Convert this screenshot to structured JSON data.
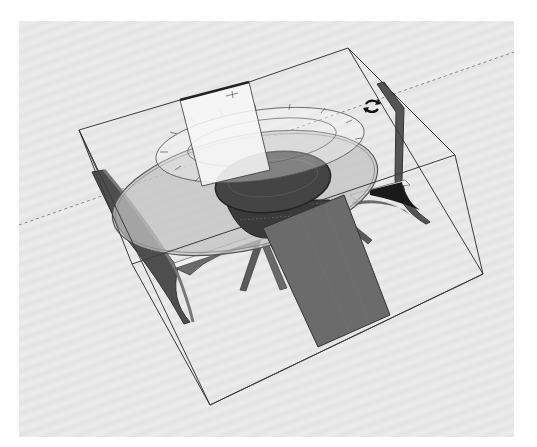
{
  "app": {
    "view": "3D model viewport",
    "active_tool": "rotate",
    "cursor_icon": "rotate-cursor-icon"
  },
  "scene": {
    "objects": [
      {
        "name": "round-table",
        "label": "Round table with glass top and woven base"
      },
      {
        "name": "chair-left",
        "label": "Chair (left)"
      },
      {
        "name": "chair-right",
        "label": "Chair (right)"
      },
      {
        "name": "chair-front",
        "label": "Chair (front, back panel)"
      }
    ],
    "selection": "bounding box around table and chairs",
    "protractor": "rotation protractor (visible)",
    "inference_line": "dashed axis guide"
  },
  "colors": {
    "background": "#e6e6e6",
    "bbox_edge": "#3a3a3a",
    "chair_dark": "#5a5a5a",
    "chair_panel": "#6e6e6e",
    "table_glass": "#b8b8b8",
    "table_base": "#3c3c3c",
    "highlight_face": "#f4f4f4"
  }
}
